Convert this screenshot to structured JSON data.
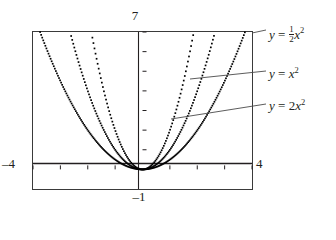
{
  "figure": {
    "title": "",
    "background": "#ffffff",
    "ink": "#231f20"
  },
  "axis_labels": {
    "top": "7",
    "bottom": "–1",
    "left": "–4",
    "right": "4"
  },
  "equations": {
    "half": {
      "lhs": "y",
      "eq": "=",
      "coef_num": "1",
      "coef_den": "2",
      "var": "x",
      "power": "2"
    },
    "one": {
      "lhs": "y",
      "eq": "=",
      "coef": "",
      "var": "x",
      "power": "2"
    },
    "two": {
      "lhs": "y",
      "eq": "=",
      "coef": "2",
      "var": "x",
      "power": "2"
    }
  },
  "chart_data": {
    "type": "line",
    "title": "",
    "xlabel": "",
    "ylabel": "",
    "xlim": [
      -4,
      4
    ],
    "ylim": [
      -1,
      7
    ],
    "grid": false,
    "legend": "right-callouts",
    "x_ticks": [
      -4,
      -3,
      -2,
      -1,
      0,
      1,
      2,
      3,
      4
    ],
    "y_ticks": [
      1,
      2,
      3,
      4,
      5,
      6,
      7
    ],
    "axis_corner_labels": {
      "top": "7",
      "bottom": "-1",
      "left": "-4",
      "right": "4"
    },
    "series": [
      {
        "name": "y = 1/2 x^2",
        "coefficient": 0.5,
        "expression": "0.5*x^2",
        "style": "dotted",
        "color": "#000000",
        "x": [
          -3.74,
          -3.4,
          -3.0,
          -2.6,
          -2.2,
          -1.8,
          -1.4,
          -1.0,
          -0.6,
          -0.2,
          0.0,
          0.2,
          0.6,
          1.0,
          1.4,
          1.8,
          2.2,
          2.6,
          3.0,
          3.4,
          3.74
        ],
        "y": [
          7.0,
          5.78,
          4.5,
          3.38,
          2.42,
          1.62,
          0.98,
          0.5,
          0.18,
          0.02,
          0.0,
          0.02,
          0.18,
          0.5,
          0.98,
          1.62,
          2.42,
          3.38,
          4.5,
          5.78,
          7.0
        ]
      },
      {
        "name": "y = x^2",
        "coefficient": 1,
        "expression": "x^2",
        "style": "dotted",
        "color": "#000000",
        "x": [
          -2.646,
          -2.4,
          -2.0,
          -1.6,
          -1.2,
          -0.8,
          -0.4,
          0.0,
          0.4,
          0.8,
          1.2,
          1.6,
          2.0,
          2.4,
          2.646
        ],
        "y": [
          7.0,
          5.76,
          4.0,
          2.56,
          1.44,
          0.64,
          0.16,
          0.0,
          0.16,
          0.64,
          1.44,
          2.56,
          4.0,
          5.76,
          7.0
        ]
      },
      {
        "name": "y = 2x^2",
        "coefficient": 2,
        "expression": "2*x^2",
        "style": "dotted",
        "color": "#000000",
        "x": [
          -1.871,
          -1.7,
          -1.4,
          -1.1,
          -0.8,
          -0.5,
          -0.2,
          0.0,
          0.2,
          0.5,
          0.8,
          1.1,
          1.4,
          1.7,
          1.871
        ],
        "y": [
          7.0,
          5.78,
          3.92,
          2.42,
          1.28,
          0.5,
          0.08,
          0.0,
          0.08,
          0.5,
          1.28,
          2.42,
          3.92,
          5.78,
          7.0
        ]
      }
    ],
    "annotations": [
      {
        "text": "y = 1/2 x^2",
        "target_series": "y = 1/2 x^2",
        "leader": true
      },
      {
        "text": "y = x^2",
        "target_series": "y = x^2",
        "leader": true
      },
      {
        "text": "y = 2x^2",
        "target_series": "y = 2x^2",
        "leader": true
      }
    ]
  }
}
